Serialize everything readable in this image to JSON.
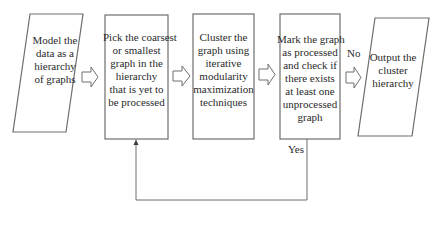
{
  "diagram": {
    "type": "flowchart",
    "nodes": [
      {
        "id": "model-data",
        "shape": "parallelogram",
        "lines": [
          "Model the",
          "data as a",
          "hierarchy",
          "of graphs"
        ]
      },
      {
        "id": "pick-graph",
        "shape": "rectangle",
        "lines": [
          "Pick the coarsest",
          "or smallest",
          "graph in the",
          "hierarchy",
          "that is yet to",
          "be processed"
        ]
      },
      {
        "id": "cluster-graph",
        "shape": "rectangle",
        "lines": [
          "Cluster the",
          "graph using",
          "iterative",
          "modularity",
          "maximization",
          "techniques"
        ]
      },
      {
        "id": "mark-check",
        "shape": "rectangle",
        "lines": [
          "Mark the graph",
          "as processed",
          "and check if",
          "there exists",
          "at least one",
          "unprocessed",
          "graph"
        ]
      },
      {
        "id": "output-hierarchy",
        "shape": "parallelogram",
        "lines": [
          "Output the",
          "cluster",
          "hierarchy"
        ]
      }
    ],
    "edges": [
      {
        "from": "model-data",
        "to": "pick-graph",
        "style": "block-arrow",
        "label": ""
      },
      {
        "from": "pick-graph",
        "to": "cluster-graph",
        "style": "block-arrow",
        "label": ""
      },
      {
        "from": "cluster-graph",
        "to": "mark-check",
        "style": "block-arrow",
        "label": ""
      },
      {
        "from": "mark-check",
        "to": "output-hierarchy",
        "style": "block-arrow",
        "label": "No"
      },
      {
        "from": "mark-check",
        "to": "pick-graph",
        "style": "line-arrow",
        "label": "Yes"
      }
    ],
    "labels": {
      "no": "No",
      "yes": "Yes"
    },
    "colors": {
      "stroke": "#6e6e6e",
      "text": "#2a2a2a",
      "background": "#ffffff"
    }
  }
}
